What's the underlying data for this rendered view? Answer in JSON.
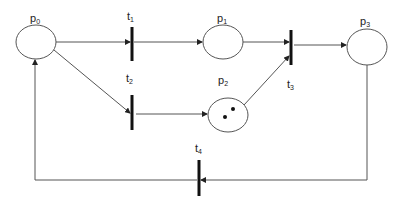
{
  "diagram": {
    "type": "petri-net",
    "places": [
      {
        "id": "p0",
        "label": "p",
        "sub": "0",
        "cx": 36,
        "cy": 42,
        "rx": 20,
        "ry": 17,
        "tokens": 0,
        "lx": 36,
        "ly": 22
      },
      {
        "id": "p1",
        "label": "p",
        "sub": "1",
        "cx": 223,
        "cy": 42,
        "rx": 20,
        "ry": 17,
        "tokens": 0,
        "lx": 223,
        "ly": 22
      },
      {
        "id": "p2",
        "label": "p",
        "sub": "2",
        "cx": 228,
        "cy": 115,
        "rx": 20,
        "ry": 17,
        "tokens": 2,
        "lx": 223,
        "ly": 83
      },
      {
        "id": "p3",
        "label": "p",
        "sub": "3",
        "cx": 367,
        "cy": 47,
        "rx": 20,
        "ry": 18,
        "tokens": 0,
        "lx": 366,
        "ly": 26
      }
    ],
    "transitions": [
      {
        "id": "t1",
        "label": "t",
        "sub": "1",
        "x": 132,
        "y1": 27,
        "y2": 61,
        "lx": 130,
        "ly": 20
      },
      {
        "id": "t2",
        "label": "t",
        "sub": "2",
        "x": 132,
        "y1": 95,
        "y2": 130,
        "lx": 129,
        "ly": 82
      },
      {
        "id": "t3",
        "label": "t",
        "sub": "3",
        "x": 291,
        "y1": 30,
        "y2": 65,
        "lx": 289,
        "ly": 89
      },
      {
        "id": "t4",
        "label": "t",
        "sub": "4",
        "x": 199,
        "y1": 160,
        "y2": 196,
        "lx": 197,
        "ly": 152
      }
    ],
    "arcs": [
      {
        "from": "p0",
        "to": "t1"
      },
      {
        "from": "t1",
        "to": "p1"
      },
      {
        "from": "p0",
        "to": "t2"
      },
      {
        "from": "t2",
        "to": "p2"
      },
      {
        "from": "p1",
        "to": "t3"
      },
      {
        "from": "p2",
        "to": "t3"
      },
      {
        "from": "t3",
        "to": "p3"
      },
      {
        "from": "p3",
        "to": "t4"
      },
      {
        "from": "t4",
        "to": "p0"
      }
    ],
    "colors": {
      "line": "#555555",
      "transition": "#111111",
      "token": "#111111"
    }
  }
}
